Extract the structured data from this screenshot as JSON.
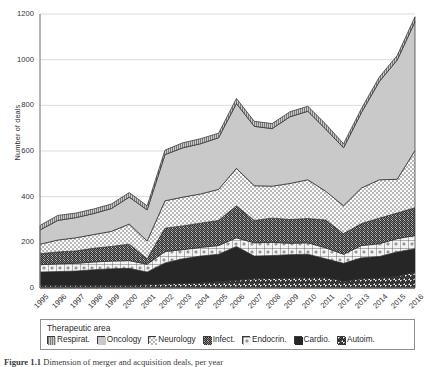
{
  "figure": {
    "caption_prefix": "Figure 1.1",
    "caption_text": "Dimension of merger and acquisition deals, per year"
  },
  "chart_data": {
    "type": "area",
    "stacked": true,
    "title": "",
    "xlabel": "",
    "ylabel": "Number of deals",
    "ylim": [
      0,
      1200
    ],
    "yticks": [
      0,
      200,
      400,
      600,
      800,
      1000,
      1200
    ],
    "grid": true,
    "legend_position": "bottom",
    "legend_title": "Therapeutic area",
    "categories": [
      "1995",
      "1996",
      "1997",
      "1998",
      "1999",
      "2000",
      "2001",
      "2002",
      "2003",
      "2004",
      "2005",
      "2006",
      "2007",
      "2008",
      "2009",
      "2010",
      "2011",
      "2012",
      "2013",
      "2014",
      "2015",
      "2016"
    ],
    "stack_order_bottom_to_top": [
      "Autoim.",
      "Cardio.",
      "Endocrin.",
      "Infect.",
      "Neurology",
      "Oncology",
      "Respirat."
    ],
    "series": [
      {
        "name": "Autoim.",
        "pattern": "diagonal-hatch-up",
        "color": "#ffffff",
        "values": [
          12,
          12,
          12,
          12,
          12,
          12,
          14,
          18,
          20,
          22,
          28,
          34,
          40,
          42,
          44,
          46,
          46,
          30,
          40,
          44,
          52,
          70
        ]
      },
      {
        "name": "Cardio.",
        "pattern": "solid-black",
        "color": "#262626",
        "values": [
          58,
          60,
          62,
          68,
          72,
          74,
          56,
          92,
          108,
          118,
          120,
          148,
          100,
          100,
          102,
          102,
          82,
          78,
          92,
          94,
          106,
          102
        ]
      },
      {
        "name": "Endocrin.",
        "pattern": "grid-dots",
        "color": "#f2f2f2",
        "values": [
          32,
          34,
          34,
          34,
          34,
          34,
          34,
          50,
          40,
          38,
          38,
          38,
          58,
          58,
          50,
          50,
          48,
          40,
          54,
          56,
          58,
          58
        ]
      },
      {
        "name": "Infect.",
        "pattern": "diagonal-hatch-dense",
        "color": "#ffffff",
        "values": [
          48,
          52,
          54,
          60,
          64,
          72,
          24,
          102,
          104,
          106,
          110,
          140,
          98,
          106,
          104,
          106,
          122,
          90,
          96,
          112,
          112,
          122
        ]
      },
      {
        "name": "Neurology",
        "pattern": "fine-dots",
        "color": "#fafafa",
        "values": [
          42,
          52,
          58,
          60,
          66,
          88,
          78,
          120,
          126,
          128,
          136,
          164,
          152,
          140,
          158,
          170,
          126,
          122,
          156,
          168,
          148,
          250
        ]
      },
      {
        "name": "Oncology",
        "pattern": "solid-gray",
        "color": "#c9c9c9",
        "values": [
          62,
          86,
          88,
          92,
          100,
          118,
          136,
          202,
          216,
          220,
          226,
          284,
          260,
          252,
          292,
          300,
          272,
          254,
          330,
          430,
          522,
          564
        ]
      },
      {
        "name": "Respirat.",
        "pattern": "vertical-lines",
        "color": "#ffffff",
        "values": [
          20,
          22,
          20,
          20,
          20,
          20,
          18,
          20,
          22,
          22,
          20,
          22,
          22,
          22,
          22,
          22,
          22,
          18,
          18,
          20,
          20,
          22
        ]
      }
    ],
    "totals": [
      274,
      318,
      328,
      346,
      368,
      418,
      360,
      604,
      636,
      654,
      678,
      830,
      730,
      720,
      772,
      796,
      718,
      632,
      786,
      924,
      1018,
      1188
    ]
  },
  "legend": {
    "title": "Therapeutic area",
    "items": [
      {
        "label": "Respirat.",
        "swatch": "vertical-lines"
      },
      {
        "label": "Oncology",
        "swatch": "solid-gray"
      },
      {
        "label": "Neurology",
        "swatch": "fine-dots"
      },
      {
        "label": "Infect.",
        "swatch": "diagonal-hatch-dense"
      },
      {
        "label": "Endocrin.",
        "swatch": "grid-dots"
      },
      {
        "label": "Cardio.",
        "swatch": "solid-black"
      },
      {
        "label": "Autoim.",
        "swatch": "diagonal-hatch-up"
      }
    ]
  }
}
